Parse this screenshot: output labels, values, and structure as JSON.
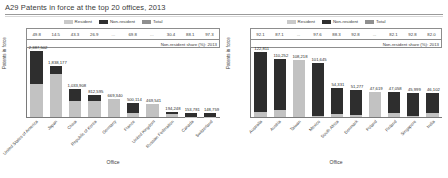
{
  "title": "A29 Patents in force at the top 20 offices, 2013",
  "legend": [
    {
      "key": "resident",
      "label": "Resident",
      "color": "#c2c2c2"
    },
    {
      "key": "non_resident",
      "label": "Non-resident",
      "color": "#2e2e2e"
    },
    {
      "key": "total",
      "label": "Total",
      "color": "#8f8f8f"
    }
  ],
  "share_note": "Non-resident share (%): 2013",
  "axis": {
    "y_label": "Patents in force",
    "x_label": "Office"
  },
  "chart_data": [
    {
      "type": "bar",
      "panel": "left",
      "title": "A29 Patents in force at the top 20 offices, 2013",
      "xlabel": "Office",
      "ylabel": "Patents in force",
      "stacked": true,
      "ylim": [
        0,
        2500000
      ],
      "grid": false,
      "legend_position": "top-center",
      "categories": [
        "United States of America",
        "Japan",
        "China",
        "Republic of Korea",
        "Germany",
        "France",
        "United Kingdom",
        "Russian Federation",
        "Canada",
        "Switzerland"
      ],
      "total_labels": [
        "2,387,502",
        "1,838,177",
        "1,033,908",
        "812,595",
        "669,340",
        "500,114",
        "469,541",
        "194,248",
        "153,781",
        "148,759"
      ],
      "values": [
        2387502,
        1838177,
        1033908,
        812595,
        669340,
        500114,
        469541,
        194248,
        153781,
        148759
      ],
      "non_resident_share_pct": [
        "49.8",
        "14.5",
        "43.3",
        "26.9",
        "...",
        "69.8",
        "...",
        "30.4",
        "88.1",
        "97.3"
      ],
      "series": [
        {
          "name": "Resident",
          "values": [
            1198525,
            1571641,
            586226,
            593807,
            669340,
            150934,
            469541,
            135237,
            18300,
            4016
          ]
        },
        {
          "name": "Non-resident",
          "values": [
            1188977,
            266536,
            447682,
            218788,
            0,
            349180,
            0,
            59011,
            135481,
            144743
          ]
        }
      ]
    },
    {
      "type": "bar",
      "panel": "right",
      "xlabel": "Office",
      "ylabel": "Patents in force",
      "stacked": true,
      "ylim": [
        0,
        130000
      ],
      "grid": false,
      "legend_position": "top-center",
      "categories": [
        "Australia",
        "Austria",
        "Taiwan",
        "Mexico",
        "South Africa",
        "Denmark",
        "Poland",
        "Finland",
        "Singapore",
        "India"
      ],
      "total_labels": [
        "122,811",
        "110,252",
        "108,218",
        "101,645",
        "54,331",
        "51,277",
        "47,619",
        "47,058",
        "45,999",
        "46,102"
      ],
      "values": [
        122811,
        110252,
        108218,
        101645,
        54331,
        51277,
        47619,
        47058,
        45999,
        46102
      ],
      "non_resident_share_pct": [
        "92.1",
        "87.1",
        "...",
        "97.6",
        "88.3",
        "92.8",
        "...",
        "82.1",
        "92.8",
        "82.0"
      ],
      "series": [
        {
          "name": "Resident",
          "values": [
            9702,
            14222,
            108218,
            2439,
            6357,
            3692,
            47619,
            8423,
            3312,
            8298
          ]
        },
        {
          "name": "Non-resident",
          "values": [
            113109,
            96030,
            0,
            99206,
            47974,
            47585,
            0,
            38635,
            42687,
            37804
          ]
        }
      ]
    }
  ]
}
